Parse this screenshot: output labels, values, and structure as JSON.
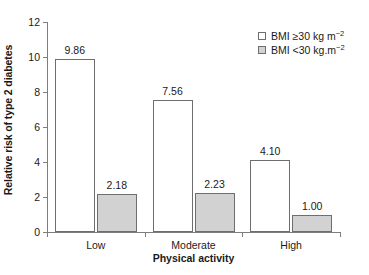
{
  "chart_data": {
    "type": "bar",
    "title": "",
    "xlabel": "Physical activity",
    "ylabel": "Relative risk of type 2 diabetes",
    "categories": [
      "Low",
      "Moderate",
      "High"
    ],
    "ylim": [
      0,
      12
    ],
    "yticks": [
      0,
      2,
      4,
      6,
      8,
      10,
      12
    ],
    "ytick_labels": [
      "0",
      "2",
      "4",
      "6",
      "8",
      "10",
      "12"
    ],
    "grid": false,
    "legend_position": "top-right",
    "series": [
      {
        "name": "BMI ≥30 kg m⁻²",
        "name_base": "BMI ≥30 kg m",
        "name_exp": "−2",
        "style": "open",
        "color": "#ffffff",
        "border_color": "#6e6e6e",
        "values": [
          9.86,
          7.56,
          4.1
        ],
        "value_labels": [
          "9.86",
          "7.56",
          "4.10"
        ]
      },
      {
        "name": "BMI <30 kg.m⁻²",
        "name_base": "BMI <30 kg.m",
        "name_exp": "−2",
        "style": "filled",
        "color": "#d2d2d2",
        "border_color": "#6e6e6e",
        "values": [
          2.18,
          2.23,
          1.0
        ],
        "value_labels": [
          "2.18",
          "2.23",
          "1.00"
        ]
      }
    ]
  },
  "clipped_header": "",
  "axis": {
    "y_title": "Relative risk of type 2 diabetes",
    "x_title": "Physical activity"
  }
}
